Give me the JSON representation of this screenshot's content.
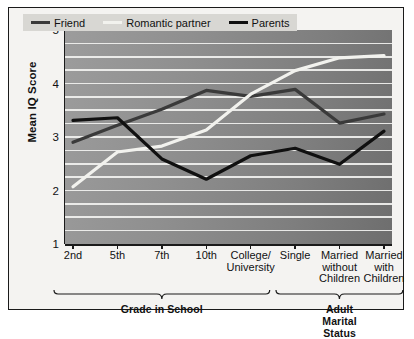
{
  "chart_data": {
    "type": "line",
    "title": "",
    "xlabel": "",
    "ylabel": "Mean IQ Score",
    "ylim": [
      1,
      5
    ],
    "yticks": [
      1,
      2,
      3,
      4,
      5
    ],
    "ytick_labels": [
      "1",
      "2",
      "3",
      "4",
      "5"
    ],
    "axis_breaks": [
      "between 1 and 2",
      "between 4 and 5"
    ],
    "grid": true,
    "grid_orientation": "horizontal",
    "legend_position": "top-left inside plot",
    "categories": [
      "2nd",
      "5th",
      "7th",
      "10th",
      "College/\nUniversity",
      "Single",
      "Married\nwithout\nChildren",
      "Married\nwith\nChildren"
    ],
    "series": [
      {
        "name": "Friend",
        "color": "#3a3a3a",
        "values": [
          2.9,
          3.22,
          3.52,
          3.87,
          3.76,
          3.89,
          3.26,
          3.43
        ]
      },
      {
        "name": "Romantic partner",
        "color": "#f2f2ee",
        "values": [
          2.07,
          2.72,
          2.83,
          3.13,
          3.8,
          4.24,
          4.48,
          4.52
        ]
      },
      {
        "name": "Parents",
        "color": "#101010",
        "values": [
          3.31,
          3.36,
          2.59,
          2.21,
          2.65,
          2.79,
          2.49,
          3.11
        ]
      }
    ],
    "groups": [
      {
        "label": "Grade in School",
        "category_start": 0,
        "category_end": 4
      },
      {
        "label": "Adult Marital Status",
        "category_start": 5,
        "category_end": 7
      }
    ]
  },
  "legend": {
    "items": [
      {
        "label": "Friend",
        "color": "#3a3a3a"
      },
      {
        "label": "Romantic partner",
        "color": "#f2f2ee"
      },
      {
        "label": "Parents",
        "color": "#101010"
      }
    ]
  },
  "colors": {
    "plot_background_light": "#9c9c9c",
    "plot_background_dark": "#6e6e6e",
    "gridline": "#f2f2f0",
    "axis": "#1a1a1a",
    "figure_background": "#f4f3f1",
    "legend_background": "#d8d7d3"
  }
}
